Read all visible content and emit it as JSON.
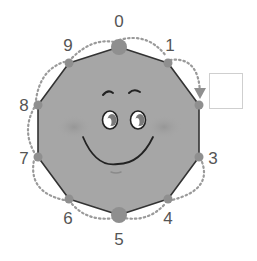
{
  "diagram": {
    "type": "decagon-counting-face",
    "colors": {
      "shape_fill": "#a6a6a6",
      "shape_outline": "#333333",
      "vertex": "#8f8f8f",
      "dotted_arrow": "#999999",
      "label": "#555555",
      "answer_box_border": "#cfcfcf",
      "cheek": "#989898"
    },
    "vertices": [
      {
        "label": "0",
        "x": 119,
        "y": 47,
        "big": true,
        "lx": 119,
        "ly": 21
      },
      {
        "label": "1",
        "x": 168,
        "y": 63,
        "big": false,
        "lx": 170,
        "ly": 45
      },
      {
        "label": "",
        "x": 199,
        "y": 105,
        "big": false,
        "lx": 0,
        "ly": 0
      },
      {
        "label": "3",
        "x": 199,
        "y": 157,
        "big": false,
        "lx": 213,
        "ly": 158
      },
      {
        "label": "4",
        "x": 168,
        "y": 199,
        "big": false,
        "lx": 168,
        "ly": 218
      },
      {
        "label": "5",
        "x": 119,
        "y": 215,
        "big": true,
        "lx": 119,
        "ly": 239
      },
      {
        "label": "6",
        "x": 69,
        "y": 199,
        "big": false,
        "lx": 68,
        "ly": 218
      },
      {
        "label": "7",
        "x": 38,
        "y": 157,
        "big": false,
        "lx": 24,
        "ly": 158
      },
      {
        "label": "8",
        "x": 38,
        "y": 105,
        "big": false,
        "lx": 24,
        "ly": 105
      },
      {
        "label": "9",
        "x": 69,
        "y": 63,
        "big": false,
        "lx": 68,
        "ly": 45
      }
    ],
    "missing_label_vertex_index": 2,
    "answer_box": {
      "value": ""
    },
    "arrow_note": "dotted arrows connect consecutive vertices; arrow head points to vertex 2"
  }
}
